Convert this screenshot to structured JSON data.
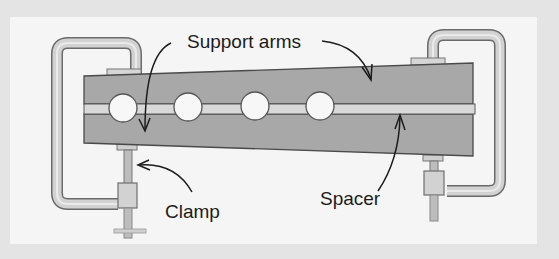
{
  "diagram": {
    "labels": {
      "support_arms": "Support arms",
      "clamp": "Clamp",
      "spacer": "Spacer"
    },
    "colors": {
      "frame": "#e4e4e4",
      "panel": "#f5f5f5",
      "beam": "#a9a9a9",
      "spacer": "#d8d8d8",
      "clamp": "#cfcfcf",
      "outline": "#555555",
      "text": "#1c1c1c"
    },
    "components": [
      {
        "id": "support-arm-upper",
        "name": "Support arm (upper)"
      },
      {
        "id": "support-arm-lower",
        "name": "Support arm (lower)"
      },
      {
        "id": "spacer",
        "name": "Spacer"
      },
      {
        "id": "clamp-left",
        "name": "Clamp (left)"
      },
      {
        "id": "clamp-right",
        "name": "Clamp (right)"
      }
    ],
    "hole_count": 4
  }
}
